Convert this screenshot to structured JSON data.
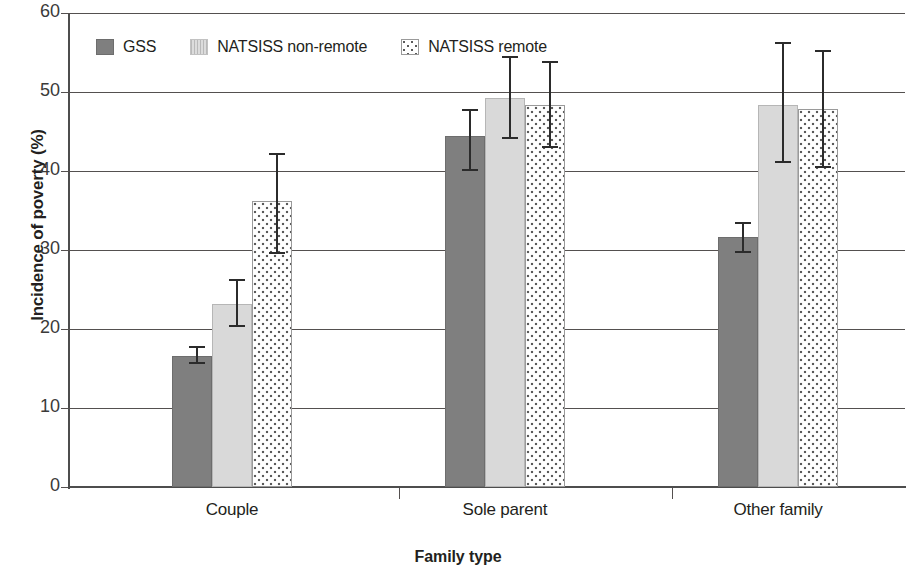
{
  "chart_data": {
    "type": "bar",
    "title": "",
    "xlabel": "Family type",
    "ylabel": "Incidence of poverty (%)",
    "categories": [
      "Couple",
      "Sole parent",
      "Other family"
    ],
    "ylim": [
      0,
      60
    ],
    "yticks": [
      0,
      10,
      20,
      30,
      40,
      50,
      60
    ],
    "ytick_labels": [
      "0",
      "10",
      "20",
      "30",
      "40",
      "50",
      "60"
    ],
    "grid": true,
    "legend_position": "top-left inside",
    "series": [
      {
        "name": "GSS",
        "fill": "solid-dark-grey",
        "color": "#7f7f7f",
        "values": [
          16.6,
          44.4,
          31.6
        ],
        "error_low": [
          15.6,
          40.0,
          29.6
        ],
        "error_high": [
          17.8,
          47.8,
          33.5
        ]
      },
      {
        "name": "NATSISS non-remote",
        "fill": "light-grey",
        "color": "#d9d9d9",
        "values": [
          23.2,
          49.3,
          48.4
        ],
        "error_low": [
          20.2,
          44.1,
          41.0
        ],
        "error_high": [
          26.3,
          54.6,
          56.3
        ]
      },
      {
        "name": "NATSISS remote",
        "fill": "dotted",
        "color": "#ffffff",
        "values": [
          36.2,
          48.4,
          47.9
        ],
        "error_low": [
          29.5,
          42.9,
          40.4
        ],
        "error_high": [
          42.3,
          53.9,
          55.3
        ]
      }
    ]
  },
  "axes": {
    "y_title": "Incidence of poverty (%)",
    "x_title": "Family type",
    "y_labels": [
      "60",
      "50",
      "40",
      "30",
      "20",
      "10",
      "0"
    ],
    "x_labels": [
      "Couple",
      "Sole parent",
      "Other family"
    ]
  },
  "legend": {
    "items": [
      {
        "label": "GSS",
        "swatch": "solid-dark-grey-swatch"
      },
      {
        "label": "NATSISS non-remote",
        "swatch": "light-grey-swatch"
      },
      {
        "label": "NATSISS remote",
        "swatch": "dotted-swatch"
      }
    ]
  }
}
